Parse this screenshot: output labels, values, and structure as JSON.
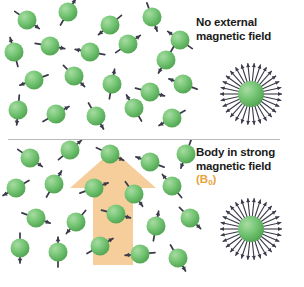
{
  "figure": {
    "background_color": "#ffffff",
    "width": 304,
    "height": 287,
    "divider_color": "#b9b9b9"
  },
  "colors": {
    "sphere_green_light": "#a8dba2",
    "sphere_green_mid": "#79c879",
    "sphere_green_dark": "#4da24d",
    "spin_needle": "#3a3a4a",
    "field_arrow": "#f5ce9b",
    "field_label_orange": "#e8a33d",
    "caption_text": "#1a1a1a",
    "divider": "#b9b9b9"
  },
  "panels": [
    {
      "id": "top",
      "caption": "No external\nmagnetic field",
      "field_symbol": null,
      "description": "Randomly oriented proton spins",
      "spins": [
        {
          "x": 27,
          "y": 20,
          "angle": 35
        },
        {
          "x": 68,
          "y": 12,
          "angle": 300
        },
        {
          "x": 110,
          "y": 25,
          "angle": 140
        },
        {
          "x": 152,
          "y": 17,
          "angle": 70
        },
        {
          "x": 180,
          "y": 40,
          "angle": 215
        },
        {
          "x": 14,
          "y": 52,
          "angle": 255
        },
        {
          "x": 50,
          "y": 46,
          "angle": 10
        },
        {
          "x": 90,
          "y": 52,
          "angle": 190
        },
        {
          "x": 128,
          "y": 44,
          "angle": 325
        },
        {
          "x": 166,
          "y": 60,
          "angle": 120
        },
        {
          "x": 34,
          "y": 80,
          "angle": 160
        },
        {
          "x": 74,
          "y": 76,
          "angle": 45
        },
        {
          "x": 112,
          "y": 84,
          "angle": 280
        },
        {
          "x": 150,
          "y": 92,
          "angle": 15
        },
        {
          "x": 183,
          "y": 84,
          "angle": 200
        },
        {
          "x": 18,
          "y": 110,
          "angle": 95
        },
        {
          "x": 56,
          "y": 114,
          "angle": 330
        },
        {
          "x": 96,
          "y": 116,
          "angle": 60
        },
        {
          "x": 134,
          "y": 108,
          "angle": 240
        },
        {
          "x": 172,
          "y": 118,
          "angle": 150
        }
      ],
      "burst": {
        "present": true,
        "x": 215,
        "y": 58,
        "size": 72,
        "ray_count": 30,
        "label": "random spin orientations"
      }
    },
    {
      "id": "bottom",
      "caption": "Body in strong\nmagnetic field",
      "field_symbol": "(B",
      "field_symbol_sub": "0",
      "field_symbol_close": ")",
      "description": "Proton spins partially aligned with B0 field arrow",
      "field_arrow": {
        "present": true,
        "direction": "up",
        "color": "#f5ce9b",
        "apex_x": 113,
        "apex_y": 150,
        "head_left_x": 70,
        "head_right_x": 156,
        "head_base_y": 188,
        "shaft_left_x": 93,
        "shaft_right_x": 133,
        "shaft_bottom_y": 265
      },
      "spins": [
        {
          "x": 30,
          "y": 18,
          "angle": 35
        },
        {
          "x": 70,
          "y": 10,
          "angle": 320
        },
        {
          "x": 110,
          "y": 14,
          "angle": 25
        },
        {
          "x": 150,
          "y": 22,
          "angle": 200
        },
        {
          "x": 186,
          "y": 14,
          "angle": 110
        },
        {
          "x": 16,
          "y": 48,
          "angle": 150
        },
        {
          "x": 54,
          "y": 44,
          "angle": 300
        },
        {
          "x": 94,
          "y": 48,
          "angle": 340
        },
        {
          "x": 134,
          "y": 54,
          "angle": 55
        },
        {
          "x": 172,
          "y": 46,
          "angle": 230
        },
        {
          "x": 36,
          "y": 78,
          "angle": 20
        },
        {
          "x": 76,
          "y": 82,
          "angle": 130
        },
        {
          "x": 116,
          "y": 74,
          "angle": 15
        },
        {
          "x": 156,
          "y": 86,
          "angle": 280
        },
        {
          "x": 190,
          "y": 78,
          "angle": 45
        },
        {
          "x": 20,
          "y": 108,
          "angle": 90
        },
        {
          "x": 58,
          "y": 112,
          "angle": 270
        },
        {
          "x": 100,
          "y": 106,
          "angle": 330
        },
        {
          "x": 140,
          "y": 114,
          "angle": 175
        },
        {
          "x": 178,
          "y": 118,
          "angle": 60
        }
      ],
      "burst": {
        "present": true,
        "x": 215,
        "y": 193,
        "size": 72,
        "ray_count": 30,
        "label": "aligned spin orientations"
      }
    }
  ]
}
